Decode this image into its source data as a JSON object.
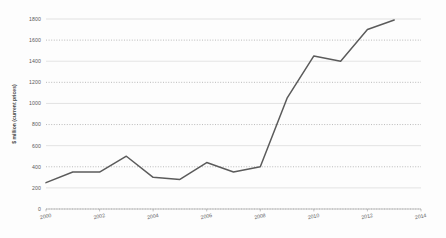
{
  "chart_data": {
    "type": "line",
    "title": "",
    "xlabel": "",
    "ylabel": "$ million (current prices)",
    "x": [
      2000,
      2001,
      2002,
      2003,
      2004,
      2005,
      2006,
      2007,
      2008,
      2009,
      2010,
      2011,
      2012,
      2013
    ],
    "values": [
      250,
      350,
      350,
      500,
      300,
      280,
      440,
      350,
      400,
      1050,
      1450,
      1400,
      1700,
      1790
    ],
    "series": [
      {
        "name": "value",
        "values": [
          250,
          350,
          350,
          500,
          300,
          280,
          440,
          350,
          400,
          1050,
          1450,
          1400,
          1700,
          1790
        ]
      }
    ],
    "xlim": [
      2000,
      2014
    ],
    "ylim": [
      0,
      1800
    ],
    "xticks": [
      2000,
      2002,
      2004,
      2006,
      2008,
      2010,
      2012,
      2014
    ],
    "xtick_labels": [
      "2000",
      "2002",
      "2004",
      "2006",
      "2008",
      "2010",
      "2012",
      "2014"
    ],
    "yticks": [
      0,
      200,
      400,
      600,
      800,
      1000,
      1200,
      1400,
      1600,
      1800
    ],
    "ytick_labels": [
      "0",
      "200",
      "400",
      "600",
      "800",
      "1000",
      "1200",
      "1400",
      "1600",
      "1800"
    ],
    "grid": true,
    "legend": "none",
    "line_color": "#5b5b5b",
    "grid_color": "#d2d2d2",
    "background_color": "#fdfdfd"
  }
}
